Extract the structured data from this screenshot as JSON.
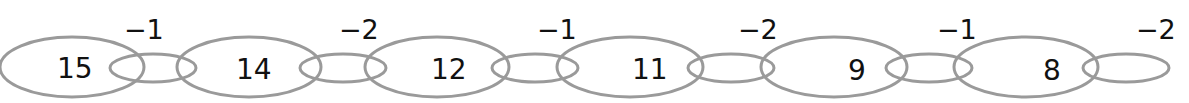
{
  "diagram": {
    "type": "number-sequence-chain",
    "stroke_color": "#9a9a9a",
    "text_color": "#111111",
    "numbers": [
      "15",
      "14",
      "12",
      "11",
      "9",
      "8"
    ],
    "steps": [
      "−1",
      "−2",
      "−1",
      "−2",
      "−1",
      "−2"
    ]
  }
}
